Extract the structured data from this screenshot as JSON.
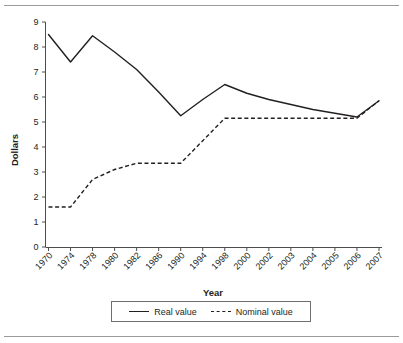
{
  "chart_data": {
    "type": "line",
    "title": "",
    "xlabel": "Year",
    "ylabel": "Dollars",
    "ylim": [
      0,
      9
    ],
    "yticks": [
      0,
      1,
      2,
      3,
      4,
      5,
      6,
      7,
      8,
      9
    ],
    "grid": false,
    "legend_position": "bottom",
    "categories": [
      "1970",
      "1974",
      "1978",
      "1980",
      "1982",
      "1986",
      "1990",
      "1994",
      "1998",
      "2000",
      "2002",
      "2003",
      "2004",
      "2005",
      "2006",
      "2007"
    ],
    "series": [
      {
        "name": "Real value",
        "style": "solid",
        "color": "#231f20",
        "values": [
          8.5,
          7.4,
          8.45,
          7.8,
          7.1,
          6.2,
          5.25,
          5.9,
          6.5,
          6.15,
          5.9,
          5.7,
          5.5,
          5.35,
          5.2,
          5.85
        ]
      },
      {
        "name": "Nominal value",
        "style": "dashed",
        "color": "#231f20",
        "values": [
          1.6,
          1.6,
          2.7,
          3.1,
          3.35,
          3.35,
          3.35,
          4.25,
          5.15,
          5.15,
          5.15,
          5.15,
          5.15,
          5.15,
          5.15,
          5.85
        ]
      }
    ]
  },
  "legend": {
    "entries": [
      {
        "label": "Real value"
      },
      {
        "label": "Nominal value"
      }
    ]
  },
  "axes": {
    "y_title": "Dollars",
    "x_title": "Year"
  }
}
